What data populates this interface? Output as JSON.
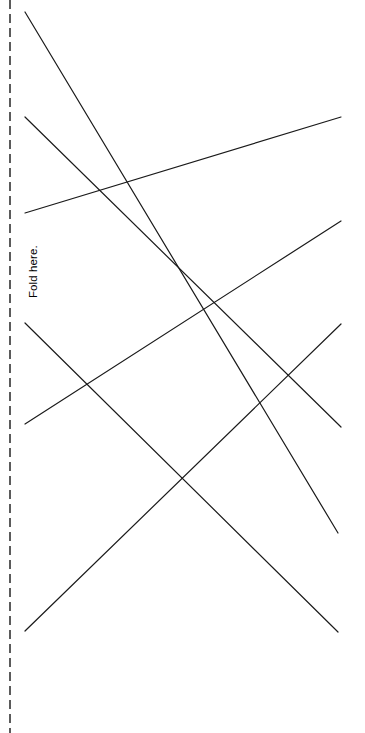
{
  "page": {
    "width": 365,
    "height": 733,
    "background_color": "#ffffff"
  },
  "fold_guide": {
    "label": "Fold here.",
    "orientation": "vertical-rotated-ccw",
    "line_style": "dashed",
    "color": "#333333",
    "x": 10,
    "y_start": 0,
    "y_end": 733,
    "dash_length": 9,
    "gap_length": 5,
    "stroke_width": 1.6
  },
  "line_art": {
    "stroke_color": "#1a1a1a",
    "stroke_width": 1.2,
    "count": 6,
    "segments": [
      {
        "name": "segment-1",
        "x1": 25,
        "y1": 12,
        "x2": 338,
        "y2": 533
      },
      {
        "name": "segment-2",
        "x1": 25,
        "y1": 117,
        "x2": 341,
        "y2": 427
      },
      {
        "name": "segment-3",
        "x1": 25,
        "y1": 213,
        "x2": 341,
        "y2": 117
      },
      {
        "name": "segment-4",
        "x1": 25,
        "y1": 323,
        "x2": 338,
        "y2": 632
      },
      {
        "name": "segment-5",
        "x1": 25,
        "y1": 424,
        "x2": 341,
        "y2": 221
      },
      {
        "name": "segment-6",
        "x1": 25,
        "y1": 631,
        "x2": 341,
        "y2": 324
      }
    ]
  }
}
